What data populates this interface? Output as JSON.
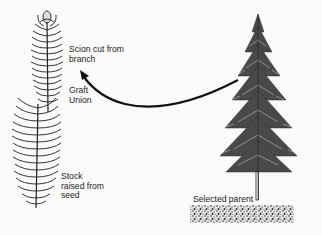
{
  "diagram": {
    "labels": {
      "scion": [
        "Scion cut from",
        "branch"
      ],
      "graft_union": [
        "Graft",
        "Union"
      ],
      "stock": [
        "Stock",
        "raised from",
        "seed"
      ],
      "parent": "Selected parent"
    },
    "elements": [
      {
        "id": "scion",
        "type": "conifer-branch-illustration"
      },
      {
        "id": "stock",
        "type": "conifer-seedling-illustration"
      },
      {
        "id": "parent-tree",
        "type": "conifer-tree-illustration"
      },
      {
        "id": "ground",
        "type": "soil-stipple"
      },
      {
        "id": "arrow",
        "type": "curved-arrow",
        "from": "parent-tree",
        "to": "scion"
      }
    ],
    "colors": {
      "ink": "#1a1a1a",
      "background": "#fbfbfa"
    }
  }
}
